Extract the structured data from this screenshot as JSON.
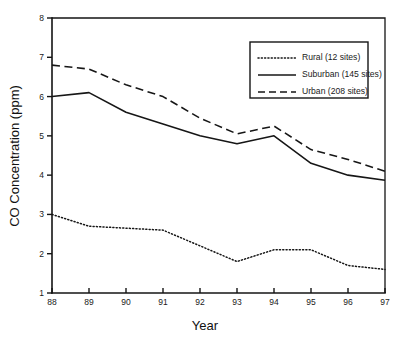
{
  "chart_data": {
    "type": "line",
    "title": "",
    "xlabel": "Year",
    "ylabel": "CO Concentration (ppm)",
    "x": [
      88,
      89,
      90,
      91,
      92,
      93,
      94,
      95,
      96,
      97
    ],
    "categories": [
      "88",
      "89",
      "90",
      "91",
      "92",
      "93",
      "94",
      "95",
      "96",
      "97"
    ],
    "xlim": [
      88,
      97
    ],
    "ylim": [
      1,
      8
    ],
    "xticks": [
      "88",
      "89",
      "90",
      "91",
      "92",
      "93",
      "94",
      "95",
      "96",
      "97"
    ],
    "yticks": [
      "1",
      "2",
      "3",
      "4",
      "5",
      "6",
      "7",
      "8"
    ],
    "grid": false,
    "legend_position": "top-right",
    "series": [
      {
        "name": "Rural (12 sites)",
        "style": "dotted",
        "values": [
          3.0,
          2.7,
          2.65,
          2.6,
          2.2,
          1.8,
          2.1,
          2.1,
          1.7,
          1.6
        ]
      },
      {
        "name": "Suburban (145 sites)",
        "style": "solid",
        "values": [
          6.0,
          6.1,
          5.6,
          5.3,
          5.0,
          4.8,
          5.0,
          4.3,
          4.0,
          3.87
        ]
      },
      {
        "name": "Urban (208 sites)",
        "style": "dashed",
        "values": [
          6.8,
          6.7,
          6.3,
          6.0,
          5.45,
          5.05,
          5.25,
          4.65,
          4.4,
          4.1
        ]
      }
    ]
  },
  "axes": {
    "y_title": "CO Concentration (ppm)",
    "x_title": "Year",
    "y_tick_labels": [
      "8",
      "7",
      "6",
      "5",
      "4",
      "3",
      "2",
      "1"
    ],
    "x_tick_labels": [
      "88",
      "89",
      "90",
      "91",
      "92",
      "93",
      "94",
      "95",
      "96",
      "97"
    ]
  },
  "legend": {
    "entries": [
      {
        "label": "Rural (12 sites)",
        "style": "dotted"
      },
      {
        "label": "Suburban (145 sites)",
        "style": "solid"
      },
      {
        "label": "Urban (208 sites)",
        "style": "dashed"
      }
    ]
  },
  "colors": {
    "ink": "#161616",
    "background": "#ffffff"
  }
}
